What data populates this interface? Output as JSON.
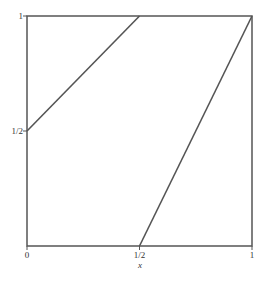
{
  "chart_data": {
    "type": "line",
    "title": "",
    "xlabel": "x",
    "ylabel": "",
    "xlim": [
      0,
      1
    ],
    "ylim": [
      0,
      1
    ],
    "grid": false,
    "legend": null,
    "x_ticks": [
      {
        "value": 0,
        "label": "0"
      },
      {
        "value": 0.5,
        "label": "1/2"
      },
      {
        "value": 1,
        "label": "1"
      }
    ],
    "y_ticks": [
      {
        "value": 0.5,
        "label": "1/2"
      },
      {
        "value": 1,
        "label": "1"
      }
    ],
    "series": [
      {
        "name": "segment-1",
        "x": [
          0,
          0.5
        ],
        "y": [
          0.5,
          1
        ]
      },
      {
        "name": "segment-2",
        "x": [
          0.5,
          1
        ],
        "y": [
          0,
          1
        ]
      }
    ],
    "colors": {
      "frame": "#555555",
      "line": "#555555",
      "text": "#333333"
    }
  }
}
